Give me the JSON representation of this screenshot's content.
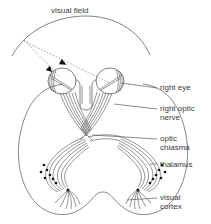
{
  "diagram": {
    "title": "visual field",
    "background_color": "#ffffff",
    "line_color": "#4a4a4a",
    "text_color": "#3a3a3a",
    "width": 211,
    "height": 224
  },
  "labels": {
    "visual_field": "visual field",
    "right_eye": "right eye",
    "right_optic_nerve_line1": "right optic",
    "right_optic_nerve_line2": "nerve",
    "optic_chiasma_line1": "optic",
    "optic_chiasma_line2": "chiasma",
    "thalamus": "thalamus",
    "visual_cortex_line1": "visual",
    "visual_cortex_line2": "cortex"
  },
  "structures": [
    {
      "name": "visual-field-arc",
      "label": "visual field"
    },
    {
      "name": "right-eye",
      "label": "right eye"
    },
    {
      "name": "left-eye",
      "label": "left eye"
    },
    {
      "name": "right-optic-nerve",
      "label": "right optic nerve"
    },
    {
      "name": "optic-chiasma",
      "label": "optic chiasma"
    },
    {
      "name": "thalamus",
      "label": "thalamus"
    },
    {
      "name": "visual-cortex",
      "label": "visual cortex"
    }
  ]
}
